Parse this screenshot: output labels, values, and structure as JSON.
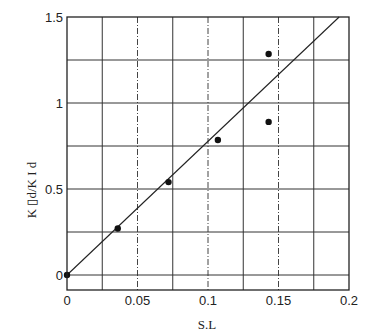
{
  "chart_data": {
    "type": "scatter",
    "title": "",
    "xlabel": "S.L",
    "ylabel": "K ▯d/K I d",
    "xlim": [
      0,
      0.2
    ],
    "ylim": [
      -0.09,
      1.5
    ],
    "x_ticks": [
      0,
      0.05,
      0.1,
      0.15,
      0.2
    ],
    "x_tick_labels": [
      "0",
      "0.05",
      "0.1",
      "0.15",
      "0.2"
    ],
    "y_ticks": [
      0,
      0.5,
      1,
      1.5
    ],
    "y_tick_labels": [
      "0",
      "0.5",
      "1",
      "1.5"
    ],
    "x_grid": [
      0.025,
      0.05,
      0.075,
      0.1,
      0.125,
      0.15,
      0.175
    ],
    "y_grid": [
      0,
      0.25,
      0.5,
      0.75,
      1,
      1.25
    ],
    "grid": true,
    "legend": null,
    "series": [
      {
        "name": "measured",
        "kind": "points",
        "x": [
          0,
          0.036,
          0.072,
          0.107,
          0.143,
          0.143
        ],
        "y": [
          0,
          0.27,
          0.54,
          0.785,
          1.285,
          0.89
        ]
      },
      {
        "name": "fit",
        "kind": "line",
        "x": [
          0,
          0.193
        ],
        "y": [
          0,
          1.5
        ]
      }
    ]
  }
}
